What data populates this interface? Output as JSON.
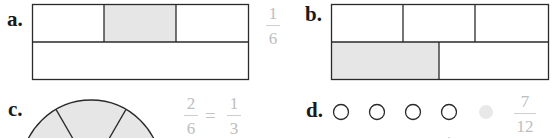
{
  "problems": [
    {
      "label": "a.",
      "figure": "rectangle",
      "rows": [
        {
          "parts": 3,
          "shaded": [
            1
          ]
        },
        {
          "parts": 1,
          "shaded": []
        }
      ],
      "answer": {
        "numerator": "1",
        "denominator": "6"
      }
    },
    {
      "label": "b.",
      "figure": "rectangle",
      "rows": [
        {
          "parts": 3,
          "shaded": []
        },
        {
          "parts": 2,
          "shaded": [
            0
          ]
        }
      ]
    },
    {
      "label": "c.",
      "figure": "circle",
      "parts": 6,
      "answer": {
        "left_numerator": "2",
        "left_denominator": "6",
        "equals": "=",
        "right_numerator": "1",
        "right_denominator": "3"
      }
    },
    {
      "label": "d.",
      "figure": "set-of-circles",
      "row1": {
        "open": 4,
        "shaded": 1
      },
      "answer": {
        "numerator": "7",
        "denominator": "12"
      }
    }
  ],
  "colors": {
    "shade": "#e6e6e6",
    "stroke": "#2a2a2a",
    "answer_text": "#bdbdbd"
  }
}
